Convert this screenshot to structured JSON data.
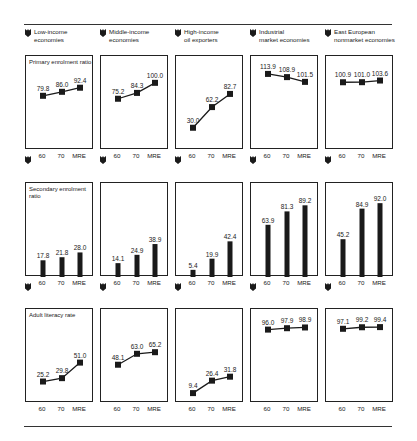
{
  "columns": [
    {
      "label_line1": "Low-income",
      "label_line2": "economies"
    },
    {
      "label_line1": "Middle-income",
      "label_line2": "economies"
    },
    {
      "label_line1": "High-income",
      "label_line2": "oil exporters"
    },
    {
      "label_line1": "Industrial",
      "label_line2": "market economies"
    },
    {
      "label_line1": "East European",
      "label_line2": "nonmarket economies"
    }
  ],
  "rows": [
    {
      "title": "Primary enrolment ratio",
      "type": "line"
    },
    {
      "title_line1": "Secondary enrolment",
      "title_line2": "ratio",
      "type": "bar"
    },
    {
      "title": "Adult literacy rate",
      "type": "line"
    }
  ],
  "x_labels": [
    "60",
    "70",
    "MRE"
  ],
  "chart_data": [
    {
      "type": "line",
      "title": "Primary enrolment ratio",
      "categories": [
        "60",
        "70",
        "MRE"
      ],
      "series": [
        {
          "name": "Low-income economies",
          "values": [
            79.8,
            86.0,
            92.4
          ]
        },
        {
          "name": "Middle-income economies",
          "values": [
            75.2,
            84.3,
            100.0
          ]
        },
        {
          "name": "High-income oil exporters",
          "values": [
            30.0,
            62.2,
            82.7
          ]
        },
        {
          "name": "Industrial market economies",
          "values": [
            113.9,
            108.9,
            101.5
          ]
        },
        {
          "name": "East European nonmarket economies",
          "values": [
            100.9,
            101.0,
            103.6
          ]
        }
      ]
    },
    {
      "type": "bar",
      "title": "Secondary enrolment ratio",
      "categories": [
        "60",
        "70",
        "MRE"
      ],
      "series": [
        {
          "name": "Low-income economies",
          "values": [
            17.8,
            21.8,
            28.0
          ]
        },
        {
          "name": "Middle-income economies",
          "values": [
            14.1,
            24.9,
            38.9
          ]
        },
        {
          "name": "High-income oil exporters",
          "values": [
            5.4,
            19.9,
            42.4
          ]
        },
        {
          "name": "Industrial market economies",
          "values": [
            63.9,
            81.3,
            89.2
          ]
        },
        {
          "name": "East European nonmarket economies",
          "values": [
            45.2,
            84.9,
            92.0
          ]
        }
      ]
    },
    {
      "type": "line",
      "title": "Adult literacy rate",
      "categories": [
        "60",
        "70",
        "MRE"
      ],
      "series": [
        {
          "name": "Low-income economies",
          "values": [
            25.2,
            29.8,
            51.0
          ]
        },
        {
          "name": "Middle-income economies",
          "values": [
            48.1,
            63.0,
            65.2
          ]
        },
        {
          "name": "High-income oil exporters",
          "values": [
            9.4,
            26.4,
            31.8
          ]
        },
        {
          "name": "Industrial market economies",
          "values": [
            96.0,
            97.9,
            98.9
          ]
        },
        {
          "name": "East European nonmarket economies",
          "values": [
            97.1,
            99.2,
            99.4
          ]
        }
      ]
    }
  ],
  "colors": {
    "ink": "#1a1a1a",
    "rule": "#333333",
    "background": "#ffffff"
  }
}
